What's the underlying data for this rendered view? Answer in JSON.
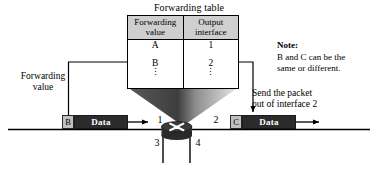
{
  "figure": {
    "title": "Forwarding table",
    "domain": "network-switching-diagram"
  },
  "forwarding_table": {
    "title": "Forwarding table",
    "headers": [
      {
        "line1": "Forwarding",
        "line2": "value"
      },
      {
        "line1": "Output",
        "line2": "interface"
      }
    ],
    "rows": [
      {
        "forwarding_value": "A",
        "output_interface": "1"
      },
      {
        "forwarding_value": "B",
        "output_interface": "2"
      }
    ],
    "continuation_symbol": "⋮",
    "header_background": "#cfcfcf",
    "border_color": "#000000"
  },
  "note": {
    "label": "Note:",
    "line1": "B and C can be the",
    "line2": "same or different."
  },
  "labels": {
    "forwarding_value_line1": "Forwarding",
    "forwarding_value_line2": "value",
    "send_packet_line1": "Send the packet",
    "send_packet_line2": "out of interface 2"
  },
  "packets": {
    "incoming": {
      "tag": "B",
      "payload": "Data",
      "tag_color": "#c0c0c0",
      "payload_color": "#2b2b2b"
    },
    "outgoing": {
      "tag": "C",
      "payload": "Data",
      "tag_color": "#c0c0c0",
      "payload_color": "#2b2b2b"
    }
  },
  "switch": {
    "glyph": "X",
    "body_color": "#3a3a3a",
    "interfaces": [
      {
        "id": "1",
        "position": "top-left"
      },
      {
        "id": "2",
        "position": "top-right"
      },
      {
        "id": "3",
        "position": "bottom-left"
      },
      {
        "id": "4",
        "position": "bottom-right"
      }
    ]
  },
  "interface_numbers": {
    "one": "1",
    "two": "2",
    "three": "3",
    "four": "4"
  },
  "colors": {
    "line": "#000000",
    "funnel_dark": "#4a4a4a",
    "funnel_light": "#d8d8d8",
    "background": "#ffffff"
  }
}
